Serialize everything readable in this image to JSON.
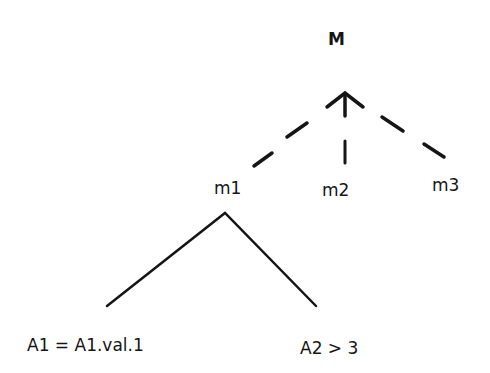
{
  "diagram": {
    "type": "tree",
    "root": {
      "label": "M"
    },
    "children": [
      {
        "id": "m1",
        "label": "m1",
        "edge": "dashed"
      },
      {
        "id": "m2",
        "label": "m2",
        "edge": "dashed"
      },
      {
        "id": "m3",
        "label": "m3",
        "edge": "dashed"
      }
    ],
    "m1_children": [
      {
        "id": "cond1",
        "label": "A1 = A1.val.1",
        "edge": "solid"
      },
      {
        "id": "cond2",
        "label": "A2 > 3",
        "edge": "solid"
      }
    ],
    "colors": {
      "line": "#151515",
      "background": "#ffffff"
    }
  }
}
